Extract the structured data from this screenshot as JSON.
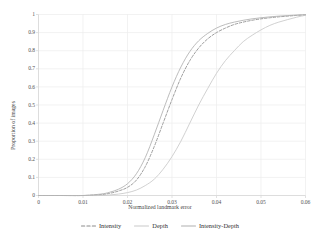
{
  "chart_data": {
    "type": "line",
    "title": "",
    "xlabel": "Normalized landmark error",
    "ylabel": "Proportion of images",
    "xlim": [
      0,
      0.06
    ],
    "ylim": [
      0,
      1
    ],
    "grid": true,
    "legend_position": "bottom",
    "xticks": [
      "0",
      "0.01",
      "0.02",
      "0.03",
      "0.04",
      "0.05",
      "0.06"
    ],
    "xtick_values": [
      0,
      0.01,
      0.02,
      0.03,
      0.04,
      0.05,
      0.06
    ],
    "yticks": [
      "0",
      "0.1",
      "0.2",
      "0.3",
      "0.4",
      "0.5",
      "0.6",
      "0.7",
      "0.8",
      "0.9",
      "1"
    ],
    "ytick_values": [
      0,
      0.1,
      0.2,
      0.3,
      0.4,
      0.5,
      0.6,
      0.7,
      0.8,
      0.9,
      1
    ],
    "x": [
      0,
      0.005,
      0.01,
      0.014,
      0.016,
      0.018,
      0.02,
      0.022,
      0.024,
      0.026,
      0.028,
      0.03,
      0.032,
      0.034,
      0.036,
      0.038,
      0.04,
      0.042,
      0.044,
      0.046,
      0.048,
      0.05,
      0.052,
      0.054,
      0.056,
      0.058,
      0.06
    ],
    "series": [
      {
        "name": "Intensity",
        "style": "dashed",
        "color": "#8c8c8c",
        "values": [
          0,
          0,
          0,
          0.005,
          0.012,
          0.025,
          0.045,
          0.085,
          0.16,
          0.27,
          0.4,
          0.53,
          0.65,
          0.745,
          0.815,
          0.865,
          0.9,
          0.925,
          0.945,
          0.958,
          0.968,
          0.976,
          0.982,
          0.987,
          0.991,
          0.995,
          0.998
        ]
      },
      {
        "name": "Depth",
        "style": "solid",
        "color": "#c9c9c9",
        "values": [
          0,
          0,
          0,
          0,
          0.003,
          0.008,
          0.016,
          0.03,
          0.055,
          0.09,
          0.145,
          0.215,
          0.3,
          0.4,
          0.5,
          0.59,
          0.675,
          0.745,
          0.8,
          0.85,
          0.885,
          0.915,
          0.94,
          0.958,
          0.972,
          0.985,
          0.996
        ]
      },
      {
        "name": "Intensity-Depth",
        "style": "solid",
        "color": "#b0b0b0",
        "values": [
          0,
          0,
          0,
          0.008,
          0.018,
          0.035,
          0.065,
          0.12,
          0.21,
          0.335,
          0.47,
          0.6,
          0.71,
          0.795,
          0.855,
          0.895,
          0.925,
          0.945,
          0.958,
          0.968,
          0.976,
          0.982,
          0.987,
          0.991,
          0.994,
          0.997,
          0.999
        ]
      }
    ]
  },
  "legend": {
    "items": [
      {
        "label": "Intensity"
      },
      {
        "label": "Depth"
      },
      {
        "label": "Intensity-Depth"
      }
    ]
  },
  "colors": {
    "axis": "#d9d9d9",
    "grid": "#ececec",
    "background": "#ffffff",
    "text": "#3a3a3a"
  }
}
